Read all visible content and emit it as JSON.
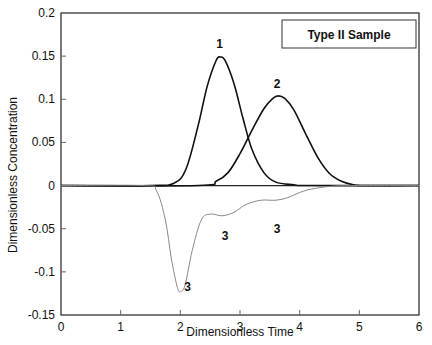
{
  "chart_data": {
    "type": "line",
    "title": "",
    "legend_box_text": "Type II Sample",
    "xlabel": "Dimensionless Time",
    "ylabel": "Dimensionless Concentration",
    "xlim": [
      0,
      6
    ],
    "ylim": [
      -0.15,
      0.2
    ],
    "xticks": [
      "0",
      "1",
      "2",
      "3",
      "4",
      "5",
      "6"
    ],
    "yticks": [
      "0.2",
      "0.15",
      "0.1",
      "0.05",
      "0",
      "-0.05",
      "-0.1",
      "-0.15"
    ],
    "grid": false,
    "series": [
      {
        "name": "1",
        "color": "#111111",
        "width": 1.6,
        "x": [
          0,
          1.5,
          1.9,
          2.1,
          2.3,
          2.45,
          2.6,
          2.67,
          2.75,
          2.9,
          3.05,
          3.2,
          3.4,
          3.6,
          3.9,
          4.2,
          6
        ],
        "y": [
          0,
          0,
          0.003,
          0.02,
          0.07,
          0.115,
          0.145,
          0.149,
          0.145,
          0.118,
          0.078,
          0.042,
          0.015,
          0.004,
          0.001,
          0,
          0
        ]
      },
      {
        "name": "2",
        "color": "#111111",
        "width": 1.6,
        "x": [
          0,
          2.3,
          2.6,
          2.8,
          3.0,
          3.2,
          3.4,
          3.55,
          3.64,
          3.75,
          3.9,
          4.1,
          4.3,
          4.5,
          4.7,
          4.9,
          5.1,
          6
        ],
        "y": [
          0,
          0,
          0.005,
          0.015,
          0.037,
          0.064,
          0.089,
          0.101,
          0.104,
          0.101,
          0.088,
          0.06,
          0.033,
          0.014,
          0.005,
          0.001,
          0,
          0
        ]
      },
      {
        "name": "3",
        "color": "#888888",
        "width": 1.0,
        "x": [
          0,
          1.4,
          1.6,
          1.75,
          1.85,
          1.95,
          2.0,
          2.08,
          2.2,
          2.35,
          2.5,
          2.7,
          2.9,
          3.1,
          3.35,
          3.6,
          3.8,
          4.0,
          4.2,
          4.5,
          4.8,
          6
        ],
        "y": [
          0,
          0,
          -0.006,
          -0.04,
          -0.085,
          -0.118,
          -0.123,
          -0.115,
          -0.075,
          -0.04,
          -0.033,
          -0.035,
          -0.031,
          -0.022,
          -0.017,
          -0.017,
          -0.014,
          -0.008,
          -0.004,
          -0.001,
          0,
          0
        ]
      }
    ],
    "annotations": [
      {
        "text": "1",
        "x": 2.66,
        "y": 0.164
      },
      {
        "text": "2",
        "x": 3.62,
        "y": 0.118
      },
      {
        "text": "3",
        "x": 2.75,
        "y": -0.058
      },
      {
        "text": "3",
        "x": 3.62,
        "y": -0.05
      },
      {
        "text": "3",
        "x": 2.12,
        "y": -0.118
      }
    ]
  }
}
